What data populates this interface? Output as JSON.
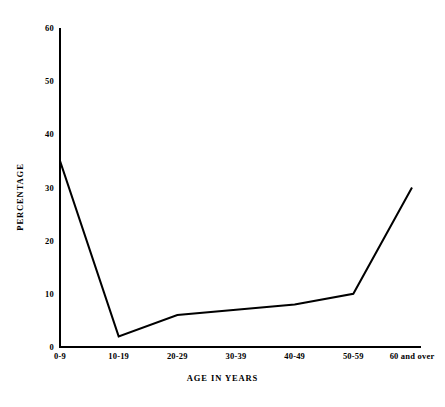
{
  "chart_data": {
    "type": "line",
    "title": "",
    "subtitle": "",
    "xlabel": "AGE IN YEARS",
    "ylabel": "PERCENTAGE",
    "categories": [
      "0-9",
      "10-19",
      "20-29",
      "30-39",
      "40-49",
      "50-59",
      "60 and over"
    ],
    "values": [
      35,
      2,
      6,
      7,
      8,
      10,
      30
    ],
    "series": [
      {
        "name": "Percentage",
        "values": [
          35,
          2,
          6,
          7,
          8,
          10,
          30
        ]
      }
    ],
    "ylim": [
      0,
      60
    ],
    "yticks": [
      0,
      10,
      20,
      30,
      40,
      50,
      60
    ],
    "ytick_labels": [
      "0",
      "10",
      "20",
      "30",
      "40",
      "50",
      "60"
    ],
    "grid": false,
    "legend": false,
    "legend_position": "none",
    "annotations": [],
    "line_color": "#000000",
    "background_color": "#ffffff",
    "axis_color": "#000000",
    "markers": false
  }
}
